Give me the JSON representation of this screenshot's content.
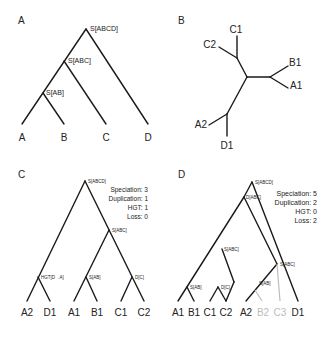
{
  "panels": {
    "a": {
      "label": "A",
      "nodes": [
        "S[ABCD]",
        "S[ABC]",
        "S[AB]"
      ],
      "leaves": [
        "A",
        "B",
        "C",
        "D"
      ]
    },
    "b": {
      "label": "B",
      "leaves": [
        "C1",
        "C2",
        "B1",
        "A1",
        "A2",
        "D1"
      ]
    },
    "c": {
      "label": "C",
      "nodes": [
        "S[ABCD]",
        "S[ABC]",
        "HGT[D→A]",
        "S[AB]",
        "D[C]"
      ],
      "stats": [
        "Speciation: 3",
        "Duplication: 1",
        "HGT: 1",
        "Loss: 0"
      ],
      "leaves": [
        "A2",
        "D1",
        "A1",
        "B1",
        "C1",
        "C2"
      ]
    },
    "d": {
      "label": "D",
      "nodes": [
        "S[ABCD]",
        "D[ABC]",
        "S[ABC]",
        "S[AB]",
        "D[C]",
        "S[ABC]",
        "S[AB]"
      ],
      "stats": [
        "Speciation: 5",
        "Duplication: 2",
        "HGT: 0",
        "Loss: 2"
      ],
      "leaves": [
        "A1",
        "B1",
        "C1",
        "C2",
        "A2",
        "B2",
        "C3",
        "D1"
      ],
      "lost_leaves": [
        "B2",
        "C3"
      ],
      "lost_color": "#bdbdbd"
    }
  }
}
